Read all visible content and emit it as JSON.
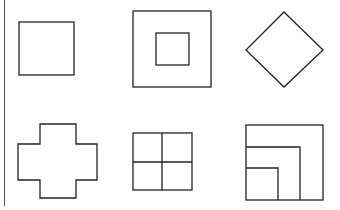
{
  "colors": {
    "stroke": "#222222",
    "background": "#ffffff",
    "divider": "#555555"
  },
  "figures": [
    {
      "id": "square",
      "label": ""
    },
    {
      "id": "nested-squares",
      "label": ""
    },
    {
      "id": "diamond",
      "label": ""
    },
    {
      "id": "cross",
      "label": ""
    },
    {
      "id": "four-grid",
      "label": ""
    },
    {
      "id": "nested-corner-squares",
      "label": ""
    }
  ]
}
